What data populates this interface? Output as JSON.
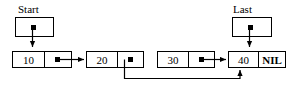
{
  "diagram": {
    "title_text": "singly linked list with start and last pointers",
    "stroke_color": "#000000",
    "background_color": "#ffffff",
    "pointers": [
      {
        "name": "start",
        "label": "Start"
      },
      {
        "name": "last",
        "label": "Last"
      }
    ],
    "nodes": [
      {
        "name": "node-10",
        "data": "10",
        "link": "pointer-dot"
      },
      {
        "name": "node-20",
        "data": "20",
        "link": "pointer-dot"
      },
      {
        "name": "node-30",
        "data": "30",
        "link": "pointer-dot"
      },
      {
        "name": "node-40",
        "data": "40",
        "link": "NIL"
      }
    ],
    "nil_label": "NIL"
  }
}
